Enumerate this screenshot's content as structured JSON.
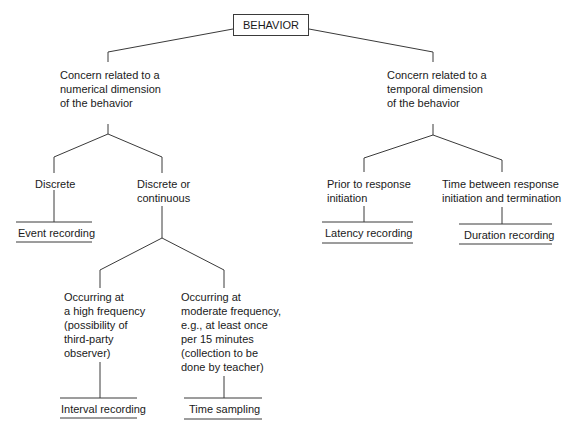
{
  "diagram": {
    "root": {
      "label": "BEHAVIOR"
    },
    "branches": {
      "numerical": {
        "label": "Concern related to a\nnumerical dimension\nof the behavior",
        "children": {
          "discrete": {
            "label": "Discrete",
            "method": "Event recording"
          },
          "discrete_or_continuous": {
            "label": "Discrete or\ncontinuous",
            "children": {
              "high_frequency": {
                "label": "Occurring at\na high frequency\n(possibility of\nthird-party\nobserver)",
                "method": "Interval recording"
              },
              "moderate_frequency": {
                "label": "Occurring at\nmoderate frequency,\ne.g., at least once\nper 15 minutes\n(collection to be\ndone by teacher)",
                "method": "Time sampling"
              }
            }
          }
        }
      },
      "temporal": {
        "label": "Concern related to a\ntemporal dimension\nof the behavior",
        "children": {
          "prior": {
            "label": "Prior to response\ninitiation",
            "method": "Latency recording"
          },
          "between": {
            "label": "Time between response\ninitiation and termination",
            "method": "Duration recording"
          }
        }
      }
    }
  }
}
